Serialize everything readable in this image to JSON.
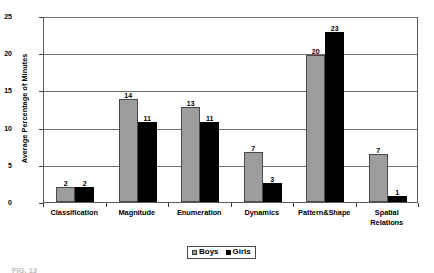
{
  "chart_data": {
    "type": "bar",
    "title": "",
    "xlabel": "",
    "ylabel": "Average Percentage of Minutes",
    "ylim": [
      0,
      25
    ],
    "yticks": [
      0,
      5,
      10,
      15,
      20,
      25
    ],
    "grid": true,
    "legend_position": "bottom-center",
    "categories": [
      "Classification",
      "Magnitude",
      "Enumeration",
      "Dynamics",
      "Pattern&Shape",
      "Spatial Relations"
    ],
    "category_lines": [
      [
        "Classification"
      ],
      [
        "Magnitude"
      ],
      [
        "Enumeration"
      ],
      [
        "Dynamics"
      ],
      [
        "Pattern&Shape"
      ],
      [
        "Spatial",
        "Relations"
      ]
    ],
    "series": [
      {
        "name": "Boys",
        "color": "#9d9d9d",
        "labels": [
          "2",
          "14",
          "13",
          "7",
          "20",
          "7"
        ],
        "values": [
          2,
          14,
          13,
          7,
          20,
          7
        ],
        "plotted": [
          2.0,
          13.9,
          12.8,
          6.7,
          19.8,
          6.5
        ]
      },
      {
        "name": "Girls",
        "color": "#000000",
        "labels": [
          "2",
          "11",
          "11",
          "3",
          "23",
          "1"
        ],
        "values": [
          2,
          11,
          11,
          3,
          23,
          1
        ],
        "plotted": [
          2.0,
          10.8,
          10.7,
          2.5,
          22.8,
          0.8
        ]
      }
    ]
  },
  "legend": {
    "items": [
      {
        "label": "Boys",
        "swatch": "boys"
      },
      {
        "label": "Girls",
        "swatch": "girls"
      }
    ]
  },
  "caption": {
    "text": "FIG. 13"
  }
}
